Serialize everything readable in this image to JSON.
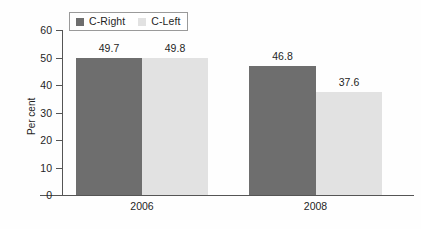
{
  "chart_data": {
    "type": "bar",
    "title": "",
    "xlabel": "",
    "ylabel": "Per cent",
    "categories": [
      "2006",
      "2008"
    ],
    "series": [
      {
        "name": "C-Right",
        "color": "#6e6e6e",
        "values": [
          49.7,
          46.8
        ]
      },
      {
        "name": "C-Left",
        "color": "#e2e2e2",
        "values": [
          49.8,
          37.6
        ]
      }
    ],
    "ylim": [
      0,
      60
    ],
    "ytick_labels": [
      "60",
      "50",
      "40",
      "30",
      "20",
      "10",
      "0"
    ],
    "ytick_values": [
      60,
      50,
      40,
      30,
      20,
      10,
      0
    ],
    "grid": false,
    "legend_position": "top-left",
    "value_labels": [
      {
        "series": "C-Right",
        "category": "2006",
        "text": "49.7"
      },
      {
        "series": "C-Left",
        "category": "2006",
        "text": "49.8"
      },
      {
        "series": "C-Right",
        "category": "2008",
        "text": "46.8"
      },
      {
        "series": "C-Left",
        "category": "2008",
        "text": "37.6"
      }
    ]
  },
  "legend": {
    "items": [
      {
        "label": "C-Right",
        "swatch": "legend-swatch-dark"
      },
      {
        "label": "C-Left",
        "swatch": "legend-swatch-light"
      }
    ]
  },
  "axes": {
    "y_title": "Per cent",
    "y_ticks": [
      "60",
      "50",
      "40",
      "30",
      "20",
      "10",
      "0"
    ],
    "x_categories": [
      "2006",
      "2008"
    ]
  },
  "colors": {
    "series_dark": "#6e6e6e",
    "series_light": "#e2e2e2",
    "axis": "#555555",
    "text": "#1f1f1f",
    "background": "#fefefe",
    "legend_border": "#9a9a9a"
  }
}
